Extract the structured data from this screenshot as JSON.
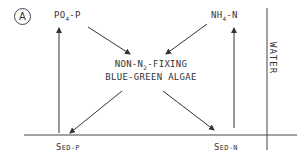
{
  "panel_label": "A",
  "nodes": {
    "po4": {
      "main": "PO",
      "sub": "4",
      "rest": "-P"
    },
    "nh4": {
      "main": "NH",
      "sub": "4",
      "rest": "-N"
    },
    "center": {
      "line1_pre": "NON-N",
      "line1_sub": "2",
      "line1_post": "-FIXING",
      "line2": "BLUE-GREEN ALGAE"
    },
    "sed_p": {
      "cap": "S",
      "rest": "ED-P"
    },
    "sed_n": {
      "cap": "S",
      "rest": "ED-N"
    }
  },
  "compartment_label": "WATER",
  "edges": [
    {
      "from": "PO4-P",
      "to": "NON-N2-FIXING BLUE-GREEN ALGAE"
    },
    {
      "from": "NH4-N",
      "to": "NON-N2-FIXING BLUE-GREEN ALGAE"
    },
    {
      "from": "NON-N2-FIXING BLUE-GREEN ALGAE",
      "to": "SED-P"
    },
    {
      "from": "NON-N2-FIXING BLUE-GREEN ALGAE",
      "to": "SED-N"
    },
    {
      "from": "SED-P",
      "to": "PO4-P"
    },
    {
      "from": "SED-N",
      "to": "NH4-N"
    }
  ]
}
